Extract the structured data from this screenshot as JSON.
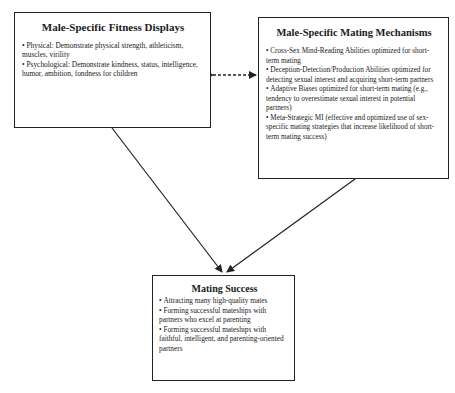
{
  "diagram": {
    "boxes": [
      {
        "id": "fitness-displays",
        "title": "Male-Specific Fitness Displays",
        "items": [
          "Physical: Demonstrate physical strength, athleticism, muscles, virility",
          "Psychological: Demonstrate kindness, status, intelligence, humor, ambition, fondness for children"
        ]
      },
      {
        "id": "mating-mechanisms",
        "title": "Male-Specific Mating Mechanisms",
        "items": [
          "Cross-Sex Mind-Reading Abilities optimized for short-term mating",
          "Deception-Detection/Production Abilities optimized for detecting sexual interest and acquiring short-term partners",
          "Adaptive Biases optimized for short-term mating (e.g., tendency to overestimate sexual interest in potential partners)",
          "Meta-Strategic MI (effective and optimized use of sex-specific mating strategies that increase likelihood of short-term mating success)"
        ]
      },
      {
        "id": "mating-success",
        "title": "Mating Success",
        "items": [
          "Attracting many high-quality mates",
          "Forming successful mateships with partners who excel at parenting",
          "Forming successful mateships with faithful, intelligent, and parenting-oriented partners"
        ]
      }
    ],
    "edges": [
      {
        "from": "fitness-displays",
        "to": "mating-mechanisms",
        "style": "dashed",
        "direction": "bidirectional"
      },
      {
        "from": "fitness-displays",
        "to": "mating-success",
        "style": "solid",
        "direction": "forward"
      },
      {
        "from": "mating-mechanisms",
        "to": "mating-success",
        "style": "solid",
        "direction": "forward"
      }
    ],
    "colors": {
      "line": "#222222",
      "background": "#ffffff",
      "text": "#1a1a1a"
    }
  }
}
